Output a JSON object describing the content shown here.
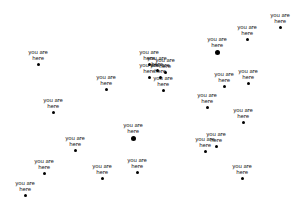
{
  "scene": {
    "background": "#ffffff",
    "marker_color": "#000000",
    "label_line1": "you are",
    "label_line2": "here"
  },
  "markers": [
    {
      "x": 38,
      "y": 64,
      "size": "small"
    },
    {
      "x": 106,
      "y": 89,
      "size": "small"
    },
    {
      "x": 280,
      "y": 27,
      "size": "small"
    },
    {
      "x": 247,
      "y": 39,
      "size": "small"
    },
    {
      "x": 217,
      "y": 52,
      "size": "big"
    },
    {
      "x": 224,
      "y": 86,
      "size": "small"
    },
    {
      "x": 248,
      "y": 83,
      "size": "small"
    },
    {
      "x": 163,
      "y": 90,
      "size": "small"
    },
    {
      "x": 160,
      "y": 77,
      "size": "small"
    },
    {
      "x": 149,
      "y": 64,
      "size": "small"
    },
    {
      "x": 149,
      "y": 77,
      "size": "small"
    },
    {
      "x": 157,
      "y": 70,
      "size": "small"
    },
    {
      "x": 165,
      "y": 72,
      "size": "small"
    },
    {
      "x": 53,
      "y": 112,
      "size": "small"
    },
    {
      "x": 133,
      "y": 138,
      "size": "big"
    },
    {
      "x": 75,
      "y": 150,
      "size": "small"
    },
    {
      "x": 44,
      "y": 173,
      "size": "small"
    },
    {
      "x": 102,
      "y": 178,
      "size": "small"
    },
    {
      "x": 137,
      "y": 172,
      "size": "small"
    },
    {
      "x": 25,
      "y": 195,
      "size": "small"
    },
    {
      "x": 207,
      "y": 107,
      "size": "small"
    },
    {
      "x": 243,
      "y": 122,
      "size": "small"
    },
    {
      "x": 216,
      "y": 146,
      "size": "small"
    },
    {
      "x": 205,
      "y": 151,
      "size": "small"
    },
    {
      "x": 242,
      "y": 178,
      "size": "small"
    }
  ]
}
